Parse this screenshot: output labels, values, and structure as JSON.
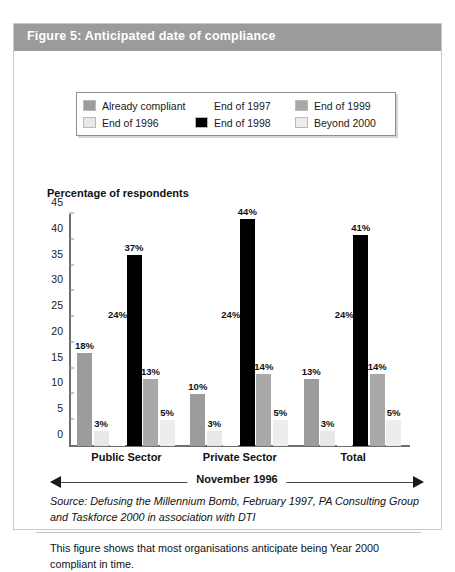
{
  "figure": {
    "header_title": "Figure 5: Anticipated date of compliance",
    "axis_title": "Percentage of respondents",
    "period_label": "November 1996",
    "source": "Source:  Defusing the Millennium Bomb, February 1997, PA Consulting Group and Taskforce 2000 in association with DTI",
    "caption": "This figure shows that most organisations anticipate being Year 2000 compliant in time."
  },
  "colors": {
    "header_bg": "#9b9b9b",
    "already_compliant": "#9c9c9c",
    "end_1996": "#e8e8e8",
    "end_1997": "#ffffff",
    "end_1998": "#000000",
    "end_1999": "#a9a9a9",
    "beyond_2000": "#ededed",
    "axis": "#6e6e6e"
  },
  "legend": {
    "items": [
      {
        "label": "Already compliant",
        "color": "#9c9c9c"
      },
      {
        "label": "End of 1997",
        "color": "#ffffff"
      },
      {
        "label": "End of 1999",
        "color": "#a9a9a9"
      },
      {
        "label": "End of 1996",
        "color": "#e8e8e8"
      },
      {
        "label": "End of 1998",
        "color": "#000000"
      },
      {
        "label": "Beyond 2000",
        "color": "#ededed"
      }
    ]
  },
  "chart_data": {
    "type": "bar",
    "title": "Figure 5: Anticipated date of compliance",
    "xlabel": "November 1996",
    "ylabel": "Percentage of respondents",
    "ylim": [
      0,
      45
    ],
    "yticks": [
      0,
      5,
      10,
      15,
      20,
      25,
      30,
      35,
      40,
      45
    ],
    "ytick_labels": [
      "0",
      "5",
      "10",
      "15",
      "20",
      "25",
      "30",
      "35",
      "40",
      "45"
    ],
    "grid": false,
    "legend_position": "top",
    "categories": [
      "Public Sector",
      "Private Sector",
      "Total"
    ],
    "series": [
      {
        "name": "Already compliant",
        "color": "#9c9c9c",
        "values": [
          18,
          10,
          13
        ],
        "labels": [
          "18%",
          "10%",
          "13%"
        ]
      },
      {
        "name": "End of 1996",
        "color": "#e8e8e8",
        "values": [
          3,
          3,
          3
        ],
        "labels": [
          "3%",
          "3%",
          "3%"
        ]
      },
      {
        "name": "End of 1997",
        "color": "#ffffff",
        "values": [
          24,
          24,
          24
        ],
        "labels": [
          "24%",
          "24%",
          "24%"
        ]
      },
      {
        "name": "End of 1998",
        "color": "#000000",
        "values": [
          37,
          44,
          41
        ],
        "labels": [
          "37%",
          "44%",
          "41%"
        ]
      },
      {
        "name": "End of 1999",
        "color": "#a9a9a9",
        "values": [
          13,
          14,
          14
        ],
        "labels": [
          "13%",
          "14%",
          "14%"
        ]
      },
      {
        "name": "Beyond 2000",
        "color": "#ededed",
        "values": [
          5,
          5,
          5
        ],
        "labels": [
          "5%",
          "5%",
          "5%"
        ]
      }
    ]
  }
}
